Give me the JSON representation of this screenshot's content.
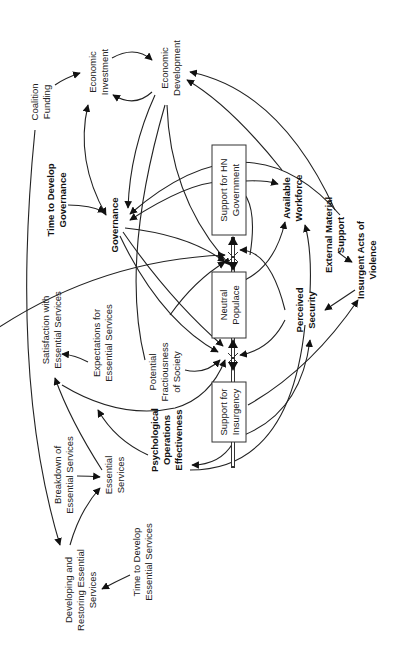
{
  "diagram": {
    "type": "causal-loop / stock-and-flow diagram (rotated 90° counter-clockwise)",
    "stocks": [
      {
        "id": "support_hn",
        "label_lines": [
          "Support for HN",
          "Government"
        ]
      },
      {
        "id": "neutral",
        "label_lines": [
          "Neutral",
          "Populace"
        ]
      },
      {
        "id": "support_ins",
        "label_lines": [
          "Support for",
          "Insurgency"
        ]
      }
    ],
    "nodes": {
      "coalition_funding": {
        "lines": [
          "Coalition",
          "Funding"
        ]
      },
      "economic_investment": {
        "lines": [
          "Economic",
          "Investment"
        ]
      },
      "economic_development": {
        "lines": [
          "Economic",
          "Development"
        ]
      },
      "time_gov": {
        "lines": [
          "Time to Develop",
          "Governance"
        ]
      },
      "governance": {
        "lines": [
          "Governance"
        ]
      },
      "available_workforce": {
        "lines": [
          "Available",
          "Workforce"
        ]
      },
      "external_material": {
        "lines": [
          "External Material",
          "Support"
        ]
      },
      "insurgent_acts": {
        "lines": [
          "Insurgent Acts of",
          "Violence"
        ]
      },
      "perceived_security": {
        "lines": [
          "Perceived",
          "Security"
        ]
      },
      "satisfaction": {
        "lines": [
          "Satisfaction with",
          "Essential Services"
        ]
      },
      "expectations": {
        "lines": [
          "Expectations for",
          "Essential Services"
        ]
      },
      "fractiousness": {
        "lines": [
          "Potential",
          "Fractiousness",
          "of Society"
        ]
      },
      "psyops": {
        "lines": [
          "Psychological",
          "Operations",
          "Effectiveness"
        ]
      },
      "breakdown": {
        "lines": [
          "Breakdown of",
          "Essential Services"
        ]
      },
      "essential_services": {
        "lines": [
          "Essential",
          "Services"
        ]
      },
      "developing": {
        "lines": [
          "Developing and",
          "Restoring Essential",
          "Services"
        ]
      },
      "time_es": {
        "lines": [
          "Time to Develop",
          "Essential Services"
        ]
      }
    }
  }
}
